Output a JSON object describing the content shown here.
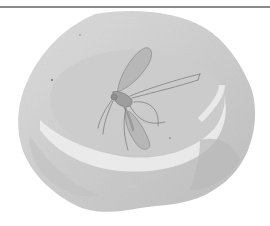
{
  "image": {
    "subject": "watercolor illustration of a red blood cell with a mosquito resting on it",
    "style": "grayscale watercolor",
    "colors": {
      "background": "#ffffff",
      "rule": "#8a8a8a",
      "cell_light": "#e2e2e2",
      "cell_mid": "#cfcfcf",
      "cell_dark": "#b8b8b8",
      "highlight": "#f2f2f2",
      "mosquito": "#8c8c8c"
    }
  }
}
